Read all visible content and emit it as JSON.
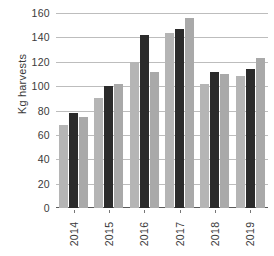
{
  "chart_data": {
    "type": "bar",
    "title": "",
    "xlabel": "",
    "ylabel": "Kg harvests",
    "categories": [
      "2014",
      "2015",
      "2016",
      "2017",
      "2018",
      "2019"
    ],
    "series": [
      {
        "name": "series-1",
        "color": "#b5b5b5",
        "values": [
          68,
          90,
          120,
          144,
          102,
          108
        ]
      },
      {
        "name": "series-2",
        "color": "#2b2b2b",
        "values": [
          78,
          100,
          142,
          147,
          112,
          114
        ]
      },
      {
        "name": "series-3",
        "color": "#a9a9a9",
        "values": [
          75,
          102,
          112,
          156,
          110,
          123
        ]
      }
    ],
    "ylim": [
      0,
      160
    ],
    "yticks": [
      0,
      20,
      40,
      60,
      80,
      100,
      120,
      140,
      160
    ],
    "ytick_labels": [
      "0",
      "20",
      "40",
      "60",
      "80",
      "100",
      "120",
      "140",
      "160"
    ],
    "grid": true,
    "grid_axis": "y",
    "grid_color": "#bdbdbd",
    "legend": false,
    "legend_position": "none",
    "axis_color": "#5a5a5a",
    "text_color": "#3a3a3a",
    "background": "#ffffff",
    "xtick_rotation": -90
  }
}
